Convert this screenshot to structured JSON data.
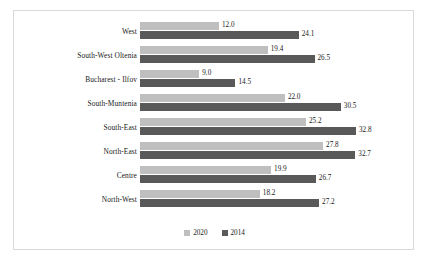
{
  "chart_data": {
    "type": "bar",
    "orientation": "horizontal",
    "title": "",
    "xlabel": "",
    "ylabel": "",
    "grid": false,
    "legend_position": "bottom",
    "xlim": [
      0,
      32.8
    ],
    "categories": [
      "West",
      "South-West Oltenia",
      "Bucharest - Ilfov",
      "South-Muntenia",
      "South-East",
      "North-East",
      "Centre",
      "North-West"
    ],
    "series": [
      {
        "name": "2020",
        "color": "#bfbfbf",
        "values": [
          12.0,
          19.4,
          9.0,
          22.0,
          25.2,
          27.8,
          19.9,
          18.2
        ],
        "labels": [
          "12.0",
          "19.4",
          "9.0",
          "22.0",
          "25.2",
          "27.8",
          "19.9",
          "18.2"
        ]
      },
      {
        "name": "2014",
        "color": "#595959",
        "values": [
          24.1,
          26.5,
          14.5,
          30.5,
          32.8,
          32.7,
          26.7,
          27.2
        ],
        "labels": [
          "24.1",
          "26.5",
          "14.5",
          "30.5",
          "32.8",
          "32.7",
          "26.7",
          "27.2"
        ]
      }
    ]
  },
  "legend": {
    "items": [
      {
        "label": "2020",
        "color": "#bfbfbf"
      },
      {
        "label": "2014",
        "color": "#595959"
      }
    ]
  },
  "style": {
    "background": "#ffffff",
    "frame_border": "#d9d9d9",
    "text_color": "#202020"
  }
}
